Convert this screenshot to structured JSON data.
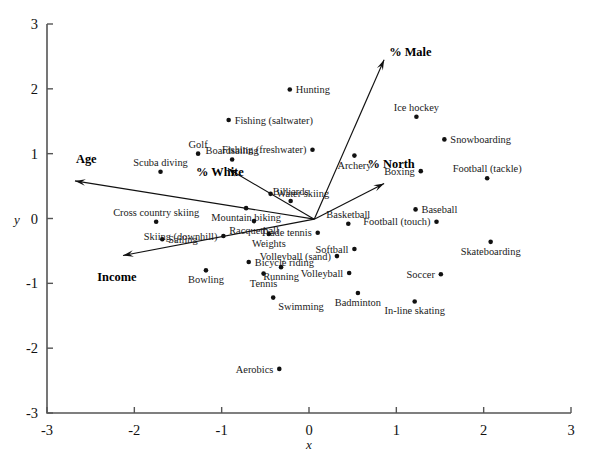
{
  "chart_data": {
    "type": "scatter",
    "title": "",
    "xlabel": "x",
    "ylabel": "y",
    "xlim": [
      -3,
      3
    ],
    "ylim": [
      -3,
      3
    ],
    "xticks": [
      "-3",
      "-2",
      "-1",
      "0",
      "1",
      "2",
      "3"
    ],
    "xtickvals": [
      -3,
      -2,
      -1,
      0,
      1,
      2,
      3
    ],
    "yticks": [
      "3",
      "2",
      "1",
      "0",
      "-1",
      "-2",
      "-3"
    ],
    "ytickvals": [
      3,
      2,
      1,
      0,
      -1,
      -2,
      -3
    ],
    "grid": false,
    "legend": "none",
    "point_color": "#111111",
    "axis_color": "#555555",
    "points": [
      {
        "label": "Hunting",
        "x": -0.22,
        "y": 1.99,
        "anchor": "left"
      },
      {
        "label": "Fishing (saltwater)",
        "x": -0.92,
        "y": 1.52,
        "anchor": "left"
      },
      {
        "label": "Ice hockey",
        "x": 1.23,
        "y": 1.57,
        "anchor": "above"
      },
      {
        "label": "Snowboarding",
        "x": 1.55,
        "y": 1.22,
        "anchor": "left"
      },
      {
        "label": "Fishing (freshwater)",
        "x": 0.04,
        "y": 1.06,
        "anchor": "left-offset"
      },
      {
        "label": "Golf",
        "x": -1.27,
        "y": 1.0,
        "anchor": "above"
      },
      {
        "label": "Boardsailing",
        "x": -0.88,
        "y": 0.91,
        "anchor": "above"
      },
      {
        "label": "Archery",
        "x": 0.52,
        "y": 0.97,
        "anchor": "below"
      },
      {
        "label": "Boxing",
        "x": 1.28,
        "y": 0.73,
        "anchor": "right"
      },
      {
        "label": "Football (tackle)",
        "x": 2.04,
        "y": 0.62,
        "anchor": "above"
      },
      {
        "label": "Scuba diving",
        "x": -1.7,
        "y": 0.72,
        "anchor": "above"
      },
      {
        "label": "Water skiing",
        "x": -0.44,
        "y": 0.38,
        "anchor": "left"
      },
      {
        "label": "Billiards",
        "x": -0.21,
        "y": 0.27,
        "anchor": "above"
      },
      {
        "label": "Cross country skiing",
        "x": -1.75,
        "y": -0.05,
        "anchor": "above"
      },
      {
        "label": "Mountain biking",
        "x": -0.72,
        "y": 0.16,
        "anchor": "below"
      },
      {
        "label": "Baseball",
        "x": 1.22,
        "y": 0.14,
        "anchor": "left"
      },
      {
        "label": "Basketball",
        "x": 0.45,
        "y": -0.08,
        "anchor": "above"
      },
      {
        "label": "Football (touch)",
        "x": 1.46,
        "y": -0.05,
        "anchor": "right"
      },
      {
        "label": "Racquetball",
        "x": -0.63,
        "y": -0.04,
        "anchor": "below"
      },
      {
        "label": "Skiing (downhill)",
        "x": -0.98,
        "y": -0.27,
        "anchor": "right"
      },
      {
        "label": "Trade tennis",
        "x": 0.1,
        "y": -0.22,
        "anchor": "right"
      },
      {
        "label": "Weights",
        "x": -0.46,
        "y": -0.24,
        "anchor": "below"
      },
      {
        "label": "Skateboarding",
        "x": 2.08,
        "y": -0.36,
        "anchor": "below"
      },
      {
        "label": "Sailing",
        "x": -1.68,
        "y": -0.32,
        "anchor": "left"
      },
      {
        "label": "Softball",
        "x": 0.52,
        "y": -0.47,
        "anchor": "right"
      },
      {
        "label": "Bicycle riding",
        "x": -0.69,
        "y": -0.67,
        "anchor": "left"
      },
      {
        "label": "Volleyball (sand)",
        "x": 0.32,
        "y": -0.58,
        "anchor": "right"
      },
      {
        "label": "Tennis",
        "x": -0.52,
        "y": -0.85,
        "anchor": "below"
      },
      {
        "label": "Running",
        "x": -0.32,
        "y": -0.75,
        "anchor": "below"
      },
      {
        "label": "Bowling",
        "x": -1.18,
        "y": -0.8,
        "anchor": "below"
      },
      {
        "label": "Volleyball",
        "x": 0.46,
        "y": -0.84,
        "anchor": "right"
      },
      {
        "label": "Soccer",
        "x": 1.51,
        "y": -0.86,
        "anchor": "right"
      },
      {
        "label": "Swimming",
        "x": -0.41,
        "y": -1.22,
        "anchor": "below-right"
      },
      {
        "label": "Badminton",
        "x": 0.56,
        "y": -1.15,
        "anchor": "below"
      },
      {
        "label": "In-line skating",
        "x": 1.21,
        "y": -1.28,
        "anchor": "below"
      },
      {
        "label": "Aerobics",
        "x": -0.34,
        "y": -2.32,
        "anchor": "right"
      }
    ],
    "vectors": [
      {
        "label": "Age",
        "ox": 0.06,
        "oy": -0.01,
        "tx": -2.68,
        "ty": 0.58,
        "lx": -2.55,
        "ly": 0.92
      },
      {
        "label": "Income",
        "ox": 0.06,
        "oy": -0.01,
        "tx": -2.13,
        "ty": -0.57,
        "lx": -2.2,
        "ly": -0.9
      },
      {
        "label": "% White",
        "ox": 0.06,
        "oy": -0.01,
        "tx": -0.93,
        "ty": 0.77,
        "lx": -1.02,
        "ly": 0.72
      },
      {
        "label": "% Male",
        "ox": 0.06,
        "oy": -0.01,
        "tx": 0.86,
        "ty": 2.45,
        "lx": 1.16,
        "ly": 2.57
      },
      {
        "label": "% North",
        "ox": 0.06,
        "oy": -0.01,
        "tx": 0.86,
        "ty": 0.54,
        "lx": 0.94,
        "ly": 0.84
      }
    ]
  }
}
